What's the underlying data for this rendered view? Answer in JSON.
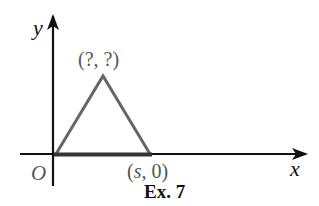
{
  "figure": {
    "caption": "Ex. 7",
    "axes": {
      "x_label": "x",
      "y_label": "y",
      "origin_label": "O"
    },
    "points": {
      "apex_label": "(?, ?)",
      "base_end_label_var": "s",
      "base_end_label_rest": ", 0)",
      "base_end_label_open": "("
    },
    "colors": {
      "axis": "#111111",
      "triangle": "#666666",
      "base": "#333333",
      "label_grey": "#555555"
    }
  }
}
